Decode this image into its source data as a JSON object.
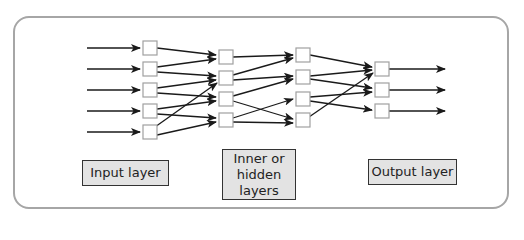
{
  "diagram": {
    "labels": {
      "input": "Input layer",
      "hidden_line1": "Inner or",
      "hidden_line2": "hidden",
      "hidden_line3": "layers",
      "output": "Output layer"
    },
    "colors": {
      "frame_border": "#a6a6a6",
      "node_border": "#a0a0a0",
      "arrow": "#1a1a1a",
      "label_fill": "#e3e3e3",
      "label_border": "#333333"
    },
    "layers": [
      {
        "name": "input",
        "node_count": 5
      },
      {
        "name": "hidden-1",
        "node_count": 4
      },
      {
        "name": "hidden-2",
        "node_count": 4
      },
      {
        "name": "output",
        "node_count": 3
      }
    ]
  }
}
